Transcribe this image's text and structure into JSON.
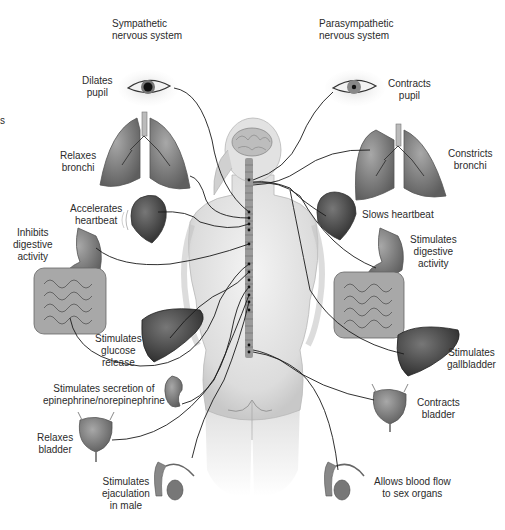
{
  "diagram": {
    "type": "anatomical illustration",
    "headers": {
      "left": [
        "Sympathetic",
        "nervous system"
      ],
      "right": [
        "Parasympathetic",
        "nervous system"
      ]
    },
    "edge_fragment": "s",
    "sympathetic_effects": [
      {
        "organ": "eye",
        "label": [
          "Dilates",
          "pupil"
        ]
      },
      {
        "organ": "lungs",
        "label": [
          "Relaxes",
          "bronchi"
        ]
      },
      {
        "organ": "heart",
        "label": [
          "Accelerates",
          "heartbeat"
        ]
      },
      {
        "organ": "stomach-intestines",
        "label": [
          "Inhibits",
          "digestive",
          "activity"
        ]
      },
      {
        "organ": "liver",
        "label": [
          "Stimulates",
          "glucose",
          "release"
        ]
      },
      {
        "organ": "adrenal-kidney",
        "label": [
          "Stimulates secretion of",
          "epinephrine/norepinephrine"
        ]
      },
      {
        "organ": "bladder",
        "label": [
          "Relaxes",
          "bladder"
        ]
      },
      {
        "organ": "male-reproductive",
        "label": [
          "Stimulates",
          "ejaculation",
          "in male"
        ]
      }
    ],
    "parasympathetic_effects": [
      {
        "organ": "eye",
        "label": [
          "Contracts",
          "pupil"
        ]
      },
      {
        "organ": "lungs",
        "label": [
          "Constricts",
          "bronchi"
        ]
      },
      {
        "organ": "heart",
        "label": [
          "Slows heartbeat"
        ]
      },
      {
        "organ": "stomach-intestines",
        "label": [
          "Stimulates",
          "digestive",
          "activity"
        ]
      },
      {
        "organ": "liver-gallbladder",
        "label": [
          "Stimulates",
          "gallbladder"
        ]
      },
      {
        "organ": "bladder",
        "label": [
          "Contracts",
          "bladder"
        ]
      },
      {
        "organ": "male-reproductive",
        "label": [
          "Allows blood flow",
          "to sex organs"
        ]
      }
    ]
  },
  "colors": {
    "background": "#ffffff",
    "text": "#2b2b2b",
    "nerve_line": "#1a1a1a",
    "body_fill": "#e6e6e6",
    "organ_dark": "#555555",
    "organ_mid": "#8a8a8a",
    "organ_light": "#b5b5b5"
  }
}
